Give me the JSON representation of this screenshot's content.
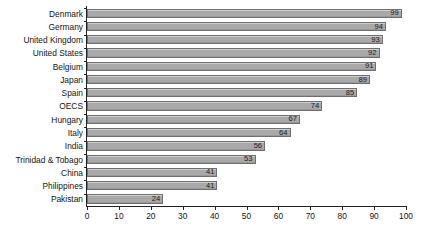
{
  "chart_data": {
    "type": "bar",
    "orientation": "horizontal",
    "title": "",
    "subtitle": "",
    "xlabel": "",
    "ylabel": "",
    "xlim": [
      0,
      100
    ],
    "xticks": [
      0,
      10,
      20,
      30,
      40,
      50,
      60,
      70,
      80,
      90,
      100
    ],
    "grid": false,
    "legend": null,
    "categories": [
      "Denmark",
      "Germany",
      "United Kingdom",
      "United States",
      "Belgium",
      "Japan",
      "Spain",
      "OECS",
      "Hungary",
      "Italy",
      "India",
      "Trinidad & Tobago",
      "China",
      "Philippines",
      "Pakistan"
    ],
    "values": [
      99,
      94,
      93,
      92,
      91,
      89,
      85,
      74,
      67,
      64,
      56,
      53,
      41,
      41,
      24
    ],
    "value_labels": [
      "99",
      "94",
      "93",
      "92",
      "91",
      "89",
      "85",
      "74",
      "67",
      "64",
      "56",
      "53",
      "41",
      "41",
      "24"
    ],
    "tick_labels": [
      "0",
      "10",
      "20",
      "30",
      "40",
      "50",
      "60",
      "70",
      "80",
      "90",
      "100"
    ],
    "colors": {
      "bar_fill": "#a9a9a9",
      "bar_border": "#6f6f6f",
      "axis": "#222222",
      "text": "#141414",
      "background": "#ffffff"
    }
  }
}
